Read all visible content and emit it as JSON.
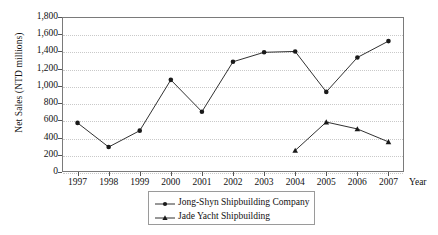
{
  "chart_data": {
    "type": "line",
    "title": "",
    "xlabel": "Year",
    "ylabel": "Net Sales (NTD millions)",
    "categories": [
      "1997",
      "1998",
      "1999",
      "2000",
      "2001",
      "2002",
      "2003",
      "2004",
      "2005",
      "2006",
      "2007"
    ],
    "x": [
      1997,
      1998,
      1999,
      2000,
      2001,
      2002,
      2003,
      2004,
      2005,
      2006,
      2007
    ],
    "ylim": [
      0,
      1800
    ],
    "yticks": [
      "0",
      "200",
      "400",
      "600",
      "800",
      "1,000",
      "1,200",
      "1,400",
      "1,600",
      "1,800"
    ],
    "ytick_values": [
      0,
      200,
      400,
      600,
      800,
      1000,
      1200,
      1400,
      1600,
      1800
    ],
    "grid": true,
    "legend_position": "bottom-center",
    "series": [
      {
        "name": "Jong-Shyn Shipbuilding Company",
        "marker": "circle",
        "color": "#1a1a1a",
        "values": [
          570,
          290,
          480,
          1070,
          700,
          1280,
          1390,
          1400,
          930,
          1330,
          1520
        ]
      },
      {
        "name": "Jade Yacht Shipbuilding",
        "marker": "triangle",
        "color": "#1a1a1a",
        "values": [
          null,
          null,
          null,
          null,
          null,
          null,
          null,
          250,
          580,
          500,
          350
        ]
      }
    ]
  },
  "legend": {
    "items": [
      {
        "label": "Jong-Shyn Shipbuilding Company",
        "marker": "circle"
      },
      {
        "label": "Jade Yacht Shipbuilding",
        "marker": "triangle"
      }
    ]
  }
}
